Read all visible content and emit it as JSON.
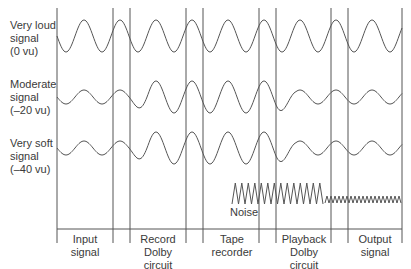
{
  "diagram": {
    "rows": [
      {
        "label_lines": [
          "Very loud",
          "signal",
          "(0 vu)"
        ]
      },
      {
        "label_lines": [
          "Moderate",
          "signal",
          "(–20 vu)"
        ]
      },
      {
        "label_lines": [
          "Very soft",
          "signal",
          "(–40 vu)"
        ]
      }
    ],
    "stages": [
      {
        "label_lines": [
          "Input",
          "signal"
        ]
      },
      {
        "label_lines": [
          "Record",
          "Dolby",
          "circuit"
        ]
      },
      {
        "label_lines": [
          "Tape",
          "recorder"
        ]
      },
      {
        "label_lines": [
          "Playback",
          "Dolby",
          "circuit"
        ]
      },
      {
        "label_lines": [
          "Output",
          "signal"
        ]
      }
    ],
    "noise_label": "Noise",
    "line_color": "#555555"
  }
}
